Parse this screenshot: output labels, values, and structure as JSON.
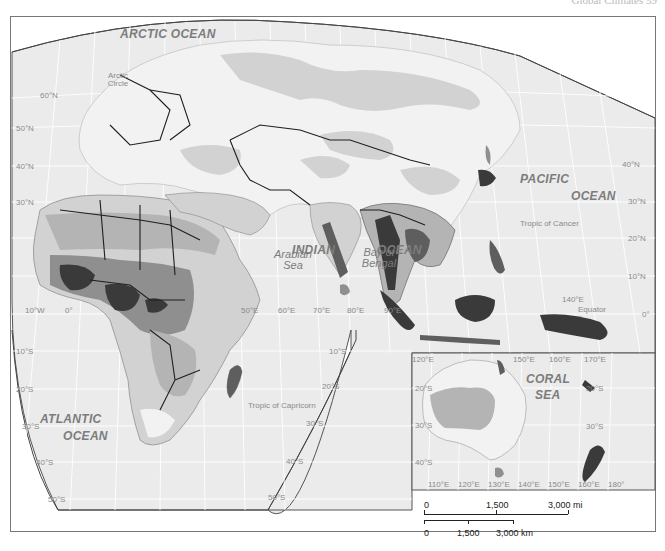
{
  "header": {
    "running_head": "Global Climates   59"
  },
  "oceans": [
    {
      "id": "arctic",
      "label": "ARCTIC OCEAN",
      "x": 148,
      "y": 36
    },
    {
      "id": "pacific1",
      "label": "PACIFIC",
      "x": 519,
      "y": 177
    },
    {
      "id": "pacific2",
      "label": "OCEAN",
      "x": 573,
      "y": 193
    },
    {
      "id": "indian1",
      "label": "INDIAN",
      "x": 292,
      "y": 246
    },
    {
      "id": "indian2",
      "label": "OCEAN",
      "x": 378,
      "y": 246
    },
    {
      "id": "atlantic1",
      "label": "ATLANTIC",
      "x": 40,
      "y": 412
    },
    {
      "id": "atlantic2",
      "label": "OCEAN",
      "x": 63,
      "y": 431
    },
    {
      "id": "coral1",
      "label": "CORAL",
      "x": 530,
      "y": 375
    },
    {
      "id": "coral2",
      "label": "SEA",
      "x": 538,
      "y": 389
    }
  ],
  "seas": [
    {
      "id": "arabian",
      "label": "Arabian Sea",
      "x": 268,
      "y": 250
    },
    {
      "id": "bengal",
      "label": "Bay of Bengal",
      "x": 356,
      "y": 250
    }
  ],
  "reference_lines": [
    {
      "label": "Arctic Circle",
      "x": 102,
      "y": 70
    },
    {
      "label": "Tropic of Cancer",
      "x": 544,
      "y": 222
    },
    {
      "label": "Equator",
      "x": 578,
      "y": 308
    },
    {
      "label": "Tropic of Capricorn",
      "x": 248,
      "y": 405
    }
  ],
  "lat_ticks": [
    {
      "label": "60°N",
      "x": 40,
      "y": 95
    },
    {
      "label": "50°N",
      "x": 16,
      "y": 128
    },
    {
      "label": "40°N",
      "x": 16,
      "y": 166
    },
    {
      "label": "30°N",
      "x": 16,
      "y": 202
    },
    {
      "label": "10°S",
      "x": 16,
      "y": 351
    },
    {
      "label": "20°S",
      "x": 16,
      "y": 389
    },
    {
      "label": "30°S",
      "x": 22,
      "y": 426
    },
    {
      "label": "40°S",
      "x": 36,
      "y": 462
    },
    {
      "label": "50°S",
      "x": 48,
      "y": 499
    },
    {
      "label": "40°N",
      "x": 622,
      "y": 164
    },
    {
      "label": "30°N",
      "x": 628,
      "y": 201
    },
    {
      "label": "20°N",
      "x": 628,
      "y": 238
    },
    {
      "label": "10°N",
      "x": 628,
      "y": 276
    },
    {
      "label": "0°",
      "x": 642,
      "y": 314
    },
    {
      "label": "10°S",
      "x": 329,
      "y": 351
    },
    {
      "label": "20°S",
      "x": 322,
      "y": 386
    },
    {
      "label": "30°S",
      "x": 306,
      "y": 423
    },
    {
      "label": "40°S",
      "x": 286,
      "y": 461
    },
    {
      "label": "50°S",
      "x": 268,
      "y": 497
    },
    {
      "label": "20°S",
      "x": 421,
      "y": 388
    },
    {
      "label": "30°S",
      "x": 421,
      "y": 425
    },
    {
      "label": "40°S",
      "x": 421,
      "y": 462
    },
    {
      "label": "20°S",
      "x": 586,
      "y": 388
    },
    {
      "label": "30°S",
      "x": 586,
      "y": 426
    }
  ],
  "lon_ticks": [
    {
      "label": "10°W",
      "x": 25,
      "y": 310
    },
    {
      "label": "0°",
      "x": 65,
      "y": 310
    },
    {
      "label": "50°E",
      "x": 241,
      "y": 310
    },
    {
      "label": "60°E",
      "x": 278,
      "y": 310
    },
    {
      "label": "70°E",
      "x": 313,
      "y": 310
    },
    {
      "label": "80°E",
      "x": 348,
      "y": 310
    },
    {
      "label": "90°E",
      "x": 385,
      "y": 310
    },
    {
      "label": "140°E",
      "x": 562,
      "y": 299
    },
    {
      "label": "120°E",
      "x": 412,
      "y": 356
    },
    {
      "label": "150°E",
      "x": 513,
      "y": 356
    },
    {
      "label": "160°E",
      "x": 549,
      "y": 356
    },
    {
      "label": "170°E",
      "x": 584,
      "y": 356
    },
    {
      "label": "110°E",
      "x": 428,
      "y": 484
    },
    {
      "label": "120°E",
      "x": 458,
      "y": 484
    },
    {
      "label": "130°E",
      "x": 488,
      "y": 484
    },
    {
      "label": "140°E",
      "x": 518,
      "y": 484
    },
    {
      "label": "150°E",
      "x": 548,
      "y": 484
    },
    {
      "label": "160°E",
      "x": 578,
      "y": 484
    },
    {
      "label": "180°",
      "x": 608,
      "y": 484
    }
  ],
  "scale_bar": {
    "miles": {
      "labels": [
        "0",
        "1,500",
        "3,000 mi"
      ]
    },
    "km": {
      "labels": [
        "0",
        "1,500",
        "3,000 km"
      ]
    }
  },
  "colors": {
    "ocean": "#ebebeb",
    "grid": "#ffffff",
    "land_lightest": "#f2f2f2",
    "shade1": "#d2d2d2",
    "shade2": "#b4b4b4",
    "shade3": "#8f8f8f",
    "shade4": "#5e5e5e",
    "shade5": "#3a3a3a",
    "border": "#1e1e1e",
    "frame": "#555555"
  }
}
